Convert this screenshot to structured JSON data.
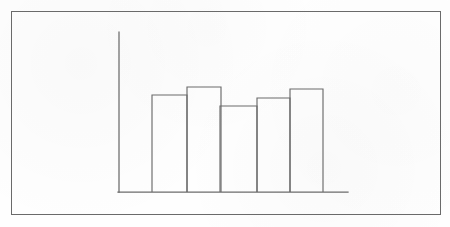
{
  "figure": {
    "title": "",
    "background_color": "#fefefe",
    "border_color": "#6a6a6a",
    "line_color": "#6b6b6b",
    "style": "hand-drawn-scanned-line-art",
    "border": {
      "x": 11,
      "y": 11,
      "width": 430,
      "height": 204
    }
  },
  "chart_data": {
    "type": "bar",
    "title": "",
    "subtitle": "",
    "xlabel": "",
    "ylabel": "",
    "categories": [
      "1",
      "2",
      "3",
      "4",
      "5"
    ],
    "values": [
      97,
      105,
      86,
      94,
      103
    ],
    "ylim": [
      0,
      160
    ],
    "grid": false,
    "legend": null,
    "legend_position": "none",
    "tick_labels": {
      "x": [],
      "y": []
    },
    "annotations": [],
    "axis_geometry": {
      "y_axis": {
        "x": 119,
        "y_top": 32,
        "y_bottom": 192
      },
      "x_axis": {
        "y": 192,
        "x_left": 118,
        "x_right": 348
      }
    },
    "bar_geometry": [
      {
        "name": "bar-1",
        "x": 152,
        "width": 35,
        "top": 95,
        "bottom": 192
      },
      {
        "name": "bar-2",
        "x": 187,
        "width": 34,
        "top": 87,
        "bottom": 192
      },
      {
        "name": "bar-3",
        "x": 220,
        "width": 37,
        "top": 106,
        "bottom": 192
      },
      {
        "name": "bar-4",
        "x": 257,
        "width": 33,
        "top": 98,
        "bottom": 192
      },
      {
        "name": "bar-5",
        "x": 290,
        "width": 33,
        "top": 89,
        "bottom": 192
      }
    ]
  }
}
